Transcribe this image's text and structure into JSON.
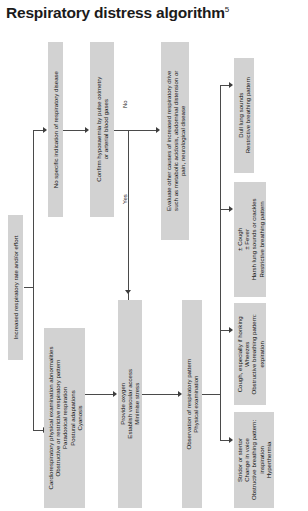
{
  "title": {
    "text": "Respiratory distress algorithm",
    "superscript": "5"
  },
  "branch_labels": {
    "yes": "Yes",
    "no": "No"
  },
  "nodes": {
    "start": {
      "name": "increased-respiratory-rate",
      "lines": [
        "Increased respiratory rate and/or effort"
      ]
    },
    "no_specific_indication": {
      "name": "no-specific-indication",
      "lines": [
        "No specific indication of respiratory disease"
      ]
    },
    "cardioresp_findings": {
      "name": "cardiorespiratory-findings",
      "lines": [
        "Cardiorespiratory physical examination abnormalities",
        "Obstructive or restrictive respiratory pattern",
        "Paradoxical respiration",
        "Postural adaptations",
        "Cyanosis"
      ]
    },
    "confirm_hypoxaemia": {
      "name": "confirm-hypoxaemia",
      "lines": [
        "Confirm hypoxaemia by pulse oximetry",
        "or arterial blood gases"
      ]
    },
    "evaluate_other_causes": {
      "name": "evaluate-other-causes",
      "lines": [
        "Evaluate other causes of increased respiratory drive",
        "such as metabolic acidosis, abdominal distension or",
        "pain, neurological disease"
      ]
    },
    "provide_oxygen": {
      "name": "provide-oxygen",
      "lines": [
        "Provide oxygen",
        "Establish vascular access",
        "Minimise stress"
      ]
    },
    "observation": {
      "name": "observation-respiratory-pattern",
      "lines": [
        "Observation of respiratory pattern",
        "Physical examination"
      ]
    },
    "outcome_pleural": {
      "name": "outcome-dull-lung-sounds",
      "lines": [
        "Dull lung sounds",
        "Restrictive breathing pattern"
      ]
    },
    "outcome_parenchymal": {
      "name": "outcome-harsh-lung-sounds",
      "lines": [
        "± Cough",
        "± Fever",
        "Harsh lung sounds or crackles",
        "Restrictive breathing pattern"
      ]
    },
    "outcome_lower_airway": {
      "name": "outcome-wheezes",
      "lines": [
        "Cough, especially if honking",
        "Wheezes",
        "Obstructive breathing pattern:",
        "expiration"
      ]
    },
    "outcome_upper_airway": {
      "name": "outcome-stridor",
      "lines": [
        "Stridor or stertor",
        "Change in voice",
        "Obstructive breathing pattern:",
        "inspiration",
        "Hyperthermia"
      ]
    }
  },
  "colors": {
    "node_fill": "#d2d2d2",
    "connector": "#4a4a4a",
    "text": "#161616",
    "background": "#ffffff"
  }
}
